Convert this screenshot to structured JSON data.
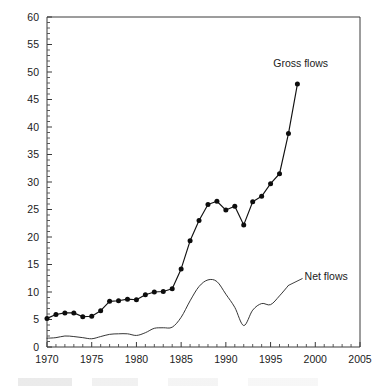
{
  "chart_data": {
    "type": "line",
    "title": "",
    "subtitle": "",
    "xlabel": "",
    "ylabel": "",
    "xlim": [
      1970,
      2005
    ],
    "ylim": [
      0,
      60
    ],
    "grid": false,
    "legend_position": "inline-annotation",
    "x_ticks": [
      1970,
      1975,
      1980,
      1985,
      1990,
      1995,
      2000,
      2005
    ],
    "x_tick_labels": [
      "1970",
      "1975",
      "1980",
      "1985",
      "1990",
      "1995",
      "2000",
      "2005"
    ],
    "x_minor_tick_step": 1,
    "y_ticks": [
      0,
      5,
      10,
      15,
      20,
      25,
      30,
      35,
      40,
      45,
      50,
      55,
      60
    ],
    "y_tick_labels": [
      "0",
      "5",
      "10",
      "15",
      "20",
      "25",
      "30",
      "35",
      "40",
      "45",
      "50",
      "55",
      "60"
    ],
    "y_minor_tick_step": 1,
    "series": [
      {
        "name": "Gross flows",
        "label": "Gross flows",
        "markers": true,
        "x": [
          1970,
          1971,
          1972,
          1973,
          1974,
          1975,
          1976,
          1977,
          1978,
          1979,
          1980,
          1981,
          1982,
          1983,
          1984,
          1985,
          1986,
          1987,
          1988,
          1989,
          1990,
          1991,
          1992,
          1993,
          1994,
          1995,
          1996,
          1997,
          1998
        ],
        "values": [
          5.2,
          5.9,
          6.2,
          6.2,
          5.5,
          5.6,
          6.6,
          8.3,
          8.4,
          8.7,
          8.6,
          9.5,
          10.0,
          10.1,
          10.6,
          14.2,
          19.3,
          23.0,
          25.9,
          26.5,
          24.9,
          25.6,
          22.2,
          26.4,
          27.4,
          29.7,
          31.5,
          38.8,
          47.8
        ],
        "label_x": 1995.3,
        "label_y": 51.0
      },
      {
        "name": "Net flows",
        "label": "Net flows",
        "markers": false,
        "x": [
          1970,
          1971,
          1972,
          1973,
          1974,
          1975,
          1976,
          1977,
          1978,
          1979,
          1980,
          1981,
          1982,
          1983,
          1984,
          1985,
          1986,
          1987,
          1988,
          1989,
          1990,
          1991,
          1992,
          1993,
          1994,
          1995,
          1996,
          1997
        ],
        "values": [
          1.6,
          1.7,
          2.0,
          1.9,
          1.7,
          1.5,
          1.9,
          2.3,
          2.4,
          2.4,
          2.1,
          2.6,
          3.4,
          3.5,
          3.6,
          5.4,
          8.4,
          11.0,
          12.2,
          11.9,
          9.6,
          7.2,
          3.9,
          6.7,
          7.9,
          7.7,
          9.3,
          11.2
        ],
        "label_x": 1998.8,
        "label_y": 12.1
      }
    ],
    "colors": {
      "gross_flows": "#111111",
      "net_flows": "#2b2b2b",
      "axis": "#3a3a3a",
      "text": "#1b1b1b",
      "background": "#ffffff"
    }
  }
}
